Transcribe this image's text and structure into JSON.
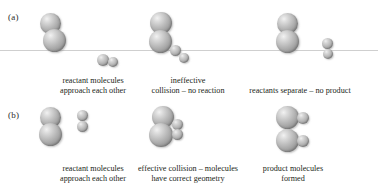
{
  "figure": {
    "background_color": "#ffffff",
    "sphere_color": "#b0b0b0",
    "line_color": "#cfcfcf",
    "text_color": "#231f20"
  },
  "rows": [
    {
      "id": "a",
      "label": "(a)",
      "description": "Ineffective collision sequence",
      "panels": [
        {
          "id": "a1",
          "caption_line1": "reactant molecules",
          "caption_line2": "approach each other"
        },
        {
          "id": "a2",
          "caption_line1": "ineffective",
          "caption_line2": "collision – no reaction"
        },
        {
          "id": "a3",
          "caption_line1": "reactants separate – no product",
          "caption_line2": ""
        }
      ]
    },
    {
      "id": "b",
      "label": "(b)",
      "description": "Effective collision sequence",
      "panels": [
        {
          "id": "b1",
          "caption_line1": "reactant molecules",
          "caption_line2": "approach each other"
        },
        {
          "id": "b2",
          "caption_line1": "effective collision – molecules",
          "caption_line2": "have correct geometry"
        },
        {
          "id": "b3",
          "caption_line1": "product molecules",
          "caption_line2": "formed"
        }
      ]
    }
  ]
}
